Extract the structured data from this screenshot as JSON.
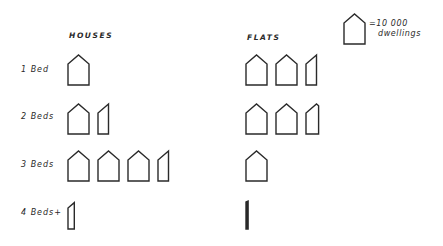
{
  "chart_data": {
    "type": "pictogram",
    "title": "",
    "unit_value": 10000,
    "unit_label": "10 000 dwellings",
    "columns": [
      "HOUSES",
      "FLATS"
    ],
    "categories": [
      "1 Bed",
      "2 Beds",
      "3 Beds",
      "4 Beds+"
    ],
    "series": [
      {
        "name": "HOUSES",
        "icons": [
          1.0,
          1.5,
          3.5,
          0.3
        ],
        "values": [
          10000,
          15000,
          35000,
          3000
        ]
      },
      {
        "name": "FLATS",
        "icons": [
          2.5,
          2.6,
          1.0,
          0.1
        ],
        "values": [
          25000,
          26000,
          10000,
          1000
        ]
      }
    ],
    "legend": {
      "symbol": "house-icon",
      "equals": "=",
      "value": "10 000",
      "unit": "dwellings",
      "position": "top-right"
    },
    "colors": {
      "ink": "#2a2a2a",
      "background": "#ffffff"
    },
    "grid": false
  },
  "headers": {
    "houses": "HOUSES",
    "flats": "FLATS"
  },
  "rows": [
    {
      "label": "1 Bed"
    },
    {
      "label": "2 Beds"
    },
    {
      "label": "3 Beds"
    },
    {
      "label": "4 Beds+"
    }
  ],
  "legend": {
    "value": "=10 000",
    "unit": "dwellings"
  }
}
